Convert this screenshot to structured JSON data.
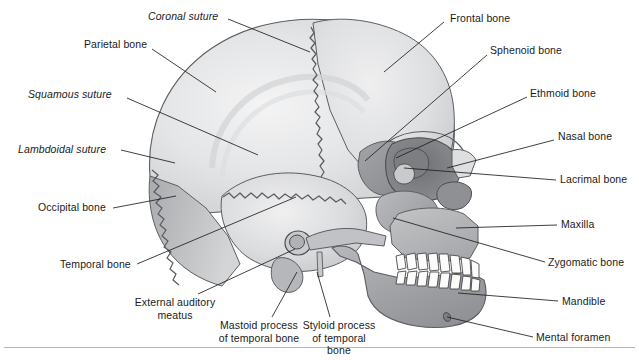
{
  "figure": {
    "background_color": "#ffffff",
    "rule_color": "#b4b4b4"
  },
  "palette": {
    "outline": "#4a4a4a",
    "leader_line": "#1f1f1f",
    "text": "#1a1a1a",
    "cranium_light": "#ececed",
    "cranium_mid": "#d8d9da",
    "cranium_shadow": "#bfc1c3",
    "temporal": "#cfd1d3",
    "occipital": "#b9bbbd",
    "sphenoid": "#9a9c9f",
    "ethmoid": "#86888b",
    "zygomatic": "#a8aaac",
    "maxilla": "#b0b2b4",
    "mandible": "#9ea0a3",
    "nasal": "#dcdddf",
    "lacrimal": "#c4c6c8",
    "teeth": "#fbfbfa"
  },
  "labels": [
    {
      "id": "coronal-suture",
      "text": "Coronal suture",
      "style": "italic",
      "x": 148,
      "y": 10,
      "leader": {
        "x1": 228,
        "y1": 19,
        "x2": 310,
        "y2": 52
      }
    },
    {
      "id": "parietal-bone",
      "text": "Parietal bone",
      "style": "regular",
      "x": 84,
      "y": 38,
      "leader": {
        "x1": 152,
        "y1": 49,
        "x2": 216,
        "y2": 92
      }
    },
    {
      "id": "squamous-suture",
      "text": "Squamous suture",
      "style": "italic",
      "x": 28,
      "y": 88,
      "leader": {
        "x1": 127,
        "y1": 98,
        "x2": 258,
        "y2": 155
      }
    },
    {
      "id": "lambdoidal-suture",
      "text": "Lambdoidal suture",
      "style": "italic",
      "x": 18,
      "y": 143,
      "leader": {
        "x1": 121,
        "y1": 150,
        "x2": 175,
        "y2": 163
      }
    },
    {
      "id": "occipital-bone",
      "text": "Occipital bone",
      "style": "regular",
      "x": 38,
      "y": 201,
      "leader": {
        "x1": 113,
        "y1": 208,
        "x2": 176,
        "y2": 196
      }
    },
    {
      "id": "temporal-bone",
      "text": "Temporal bone",
      "style": "regular",
      "x": 60,
      "y": 258,
      "leader": {
        "x1": 137,
        "y1": 264,
        "x2": 296,
        "y2": 197
      }
    },
    {
      "id": "external-auditory-meatus",
      "text": "External auditory meatus",
      "style": "two-line",
      "x": 127,
      "y": 296,
      "width": 96,
      "leader": {
        "x1": 198,
        "y1": 294,
        "x2": 295,
        "y2": 249
      }
    },
    {
      "id": "mastoid-process",
      "text": "Mastoid process of temporal bone",
      "style": "two-line",
      "x": 218,
      "y": 319,
      "width": 82,
      "leader": {
        "x1": 272,
        "y1": 317,
        "x2": 297,
        "y2": 272
      }
    },
    {
      "id": "styloid-process",
      "text": "Styloid process of temporal bone",
      "style": "two-line",
      "x": 299,
      "y": 319,
      "width": 80,
      "leader": {
        "x1": 330,
        "y1": 317,
        "x2": 317,
        "y2": 272
      }
    },
    {
      "id": "frontal-bone",
      "text": "Frontal bone",
      "style": "regular",
      "x": 450,
      "y": 12,
      "leader": {
        "x1": 444,
        "y1": 22,
        "x2": 384,
        "y2": 72
      }
    },
    {
      "id": "sphenoid-bone",
      "text": "Sphenoid bone",
      "style": "regular",
      "x": 490,
      "y": 44,
      "leader": {
        "x1": 487,
        "y1": 55,
        "x2": 365,
        "y2": 161
      }
    },
    {
      "id": "ethmoid-bone",
      "text": "Ethmoid bone",
      "style": "regular",
      "x": 530,
      "y": 87,
      "leader": {
        "x1": 527,
        "y1": 97,
        "x2": 396,
        "y2": 158
      }
    },
    {
      "id": "nasal-bone",
      "text": "Nasal bone",
      "style": "regular",
      "x": 558,
      "y": 130,
      "leader": {
        "x1": 554,
        "y1": 140,
        "x2": 447,
        "y2": 168
      }
    },
    {
      "id": "lacrimal-bone",
      "text": "Lacrimal bone",
      "style": "regular",
      "x": 560,
      "y": 173,
      "leader": {
        "x1": 556,
        "y1": 180,
        "x2": 404,
        "y2": 168
      }
    },
    {
      "id": "maxilla",
      "text": "Maxilla",
      "style": "regular",
      "x": 561,
      "y": 218,
      "leader": {
        "x1": 557,
        "y1": 225,
        "x2": 456,
        "y2": 228
      }
    },
    {
      "id": "zygomatic-bone",
      "text": "Zygomatic bone",
      "style": "regular",
      "x": 548,
      "y": 256,
      "leader": {
        "x1": 545,
        "y1": 262,
        "x2": 393,
        "y2": 218
      }
    },
    {
      "id": "mandible",
      "text": "Mandible",
      "style": "regular",
      "x": 562,
      "y": 295,
      "leader": {
        "x1": 558,
        "y1": 301,
        "x2": 458,
        "y2": 293
      }
    },
    {
      "id": "mental-foramen",
      "text": "Mental foramen",
      "style": "regular",
      "x": 536,
      "y": 331,
      "leader": {
        "x1": 533,
        "y1": 337,
        "x2": 447,
        "y2": 317
      }
    }
  ],
  "anatomy_parts": [
    {
      "id": "parietal",
      "name": "Parietal bone"
    },
    {
      "id": "frontal",
      "name": "Frontal bone"
    },
    {
      "id": "occipital",
      "name": "Occipital bone"
    },
    {
      "id": "temporal",
      "name": "Temporal bone"
    },
    {
      "id": "sphenoid",
      "name": "Sphenoid bone"
    },
    {
      "id": "ethmoid",
      "name": "Ethmoid bone"
    },
    {
      "id": "nasal",
      "name": "Nasal bone"
    },
    {
      "id": "lacrimal",
      "name": "Lacrimal bone"
    },
    {
      "id": "zygomatic",
      "name": "Zygomatic bone"
    },
    {
      "id": "maxilla",
      "name": "Maxilla"
    },
    {
      "id": "mandible",
      "name": "Mandible"
    },
    {
      "id": "mastoid-process",
      "name": "Mastoid process"
    },
    {
      "id": "styloid-process",
      "name": "Styloid process"
    },
    {
      "id": "external-auditory-meatus",
      "name": "External auditory meatus"
    },
    {
      "id": "mental-foramen",
      "name": "Mental foramen"
    },
    {
      "id": "upper-teeth",
      "name": "Upper teeth"
    },
    {
      "id": "lower-teeth",
      "name": "Lower teeth"
    },
    {
      "id": "coronal-suture",
      "name": "Coronal suture"
    },
    {
      "id": "squamous-suture",
      "name": "Squamous suture"
    },
    {
      "id": "lambdoidal-suture",
      "name": "Lambdoidal suture"
    }
  ]
}
